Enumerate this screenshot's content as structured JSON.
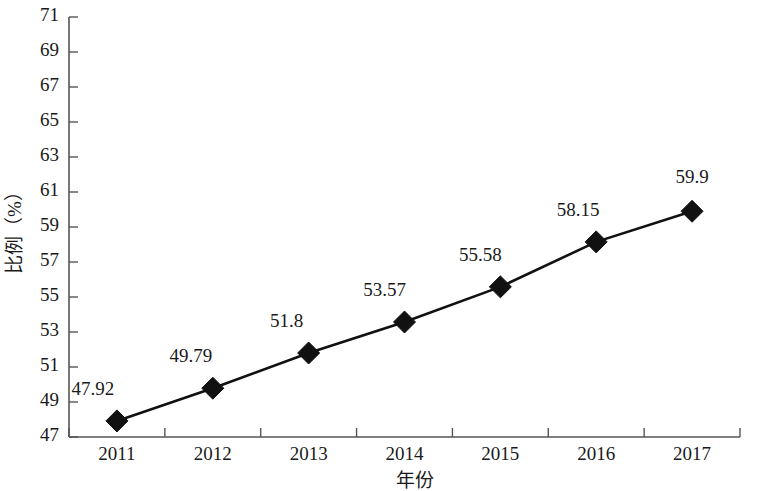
{
  "chart_data": {
    "type": "line",
    "title": "",
    "xlabel": "年份",
    "ylabel": "比例（%）",
    "categories": [
      "2011",
      "2012",
      "2013",
      "2014",
      "2015",
      "2016",
      "2017"
    ],
    "values": [
      47.92,
      49.79,
      51.8,
      53.57,
      55.58,
      58.15,
      59.9
    ],
    "point_labels": [
      "47.92",
      "49.79",
      "51.8",
      "53.57",
      "55.58",
      "58.15",
      "59.9"
    ],
    "ylim": [
      47,
      71
    ],
    "ytick_step": 2,
    "ytick_labels": [
      "71",
      "69",
      "67",
      "65",
      "63",
      "61",
      "59",
      "57",
      "55",
      "53",
      "51",
      "49",
      "47"
    ],
    "grid": false,
    "legend": null,
    "series": [
      {
        "name": "比例（%）",
        "marker": "diamond",
        "color": "#111111",
        "values": [
          47.92,
          49.79,
          51.8,
          53.57,
          55.58,
          58.15,
          59.9
        ]
      }
    ]
  },
  "colors": {
    "series": "#111111",
    "axis": "#555555",
    "text": "#1a1a1a",
    "background": "#ffffff"
  }
}
